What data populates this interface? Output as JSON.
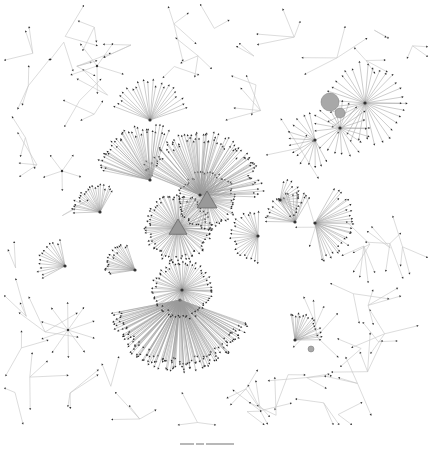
{
  "figure": {
    "type": "network-graph",
    "background": "#ffffff",
    "edge_color": "#9a9a9a",
    "node_color": "#2a2a2a",
    "highlight_color": "#a8a8a8",
    "caption": ""
  },
  "clusters": [
    {
      "name": "core-cluster-a",
      "cx": 178,
      "cy": 228,
      "r": 34,
      "count": 90,
      "shape": "triangle",
      "fan": [
        0,
        360
      ]
    },
    {
      "name": "core-cluster-b",
      "cx": 207,
      "cy": 200,
      "r": 30,
      "count": 70,
      "shape": "triangle",
      "fan": [
        0,
        360
      ]
    },
    {
      "name": "top-arc-cluster",
      "cx": 200,
      "cy": 195,
      "r": 62,
      "count": 90,
      "shape": "none",
      "fan": [
        200,
        360
      ]
    },
    {
      "name": "left-arc-cluster",
      "cx": 150,
      "cy": 180,
      "r": 55,
      "count": 40,
      "shape": "none",
      "fan": [
        190,
        290
      ]
    },
    {
      "name": "lower-cluster",
      "cx": 180,
      "cy": 300,
      "r": 70,
      "count": 140,
      "shape": "none",
      "fan": [
        20,
        170
      ]
    },
    {
      "name": "lower-dense-core",
      "cx": 182,
      "cy": 290,
      "r": 30,
      "count": 70,
      "shape": "none",
      "fan": [
        0,
        360
      ]
    },
    {
      "name": "fan-top",
      "cx": 150,
      "cy": 120,
      "r": 40,
      "count": 22,
      "shape": "none",
      "fan": [
        200,
        340
      ]
    },
    {
      "name": "right-hub-1",
      "cx": 315,
      "cy": 223,
      "r": 40,
      "count": 28,
      "shape": "none",
      "fan": [
        -60,
        80
      ]
    },
    {
      "name": "right-hub-2",
      "cx": 295,
      "cy": 222,
      "r": 30,
      "count": 18,
      "shape": "none",
      "fan": [
        180,
        300
      ]
    },
    {
      "name": "mid-hub",
      "cx": 258,
      "cy": 236,
      "r": 28,
      "count": 22,
      "shape": "none",
      "fan": [
        90,
        270
      ]
    },
    {
      "name": "left-hub",
      "cx": 100,
      "cy": 212,
      "r": 28,
      "count": 22,
      "shape": "none",
      "fan": [
        180,
        300
      ]
    },
    {
      "name": "far-left-hub",
      "cx": 65,
      "cy": 266,
      "r": 28,
      "count": 14,
      "shape": "none",
      "fan": [
        150,
        260
      ]
    },
    {
      "name": "left-mid-hub",
      "cx": 135,
      "cy": 270,
      "r": 30,
      "count": 20,
      "shape": "none",
      "fan": [
        170,
        250
      ]
    },
    {
      "name": "bottom-right-hub",
      "cx": 295,
      "cy": 340,
      "r": 28,
      "count": 18,
      "shape": "none",
      "fan": [
        -100,
        0
      ]
    },
    {
      "name": "tr-cluster-main",
      "cx": 365,
      "cy": 103,
      "r": 42,
      "count": 34,
      "shape": "none",
      "fan": [
        0,
        360
      ]
    },
    {
      "name": "tr-cluster-sub",
      "cx": 340,
      "cy": 128,
      "r": 30,
      "count": 22,
      "shape": "none",
      "fan": [
        0,
        360
      ]
    },
    {
      "name": "tr-cluster-left",
      "cx": 315,
      "cy": 140,
      "r": 28,
      "count": 14,
      "shape": "none",
      "fan": [
        60,
        260
      ]
    },
    {
      "name": "mid-right-hub",
      "cx": 280,
      "cy": 200,
      "r": 22,
      "count": 14,
      "shape": "none",
      "fan": [
        -80,
        60
      ]
    }
  ],
  "blobs": [
    {
      "name": "tr-blob-large",
      "cx": 330,
      "cy": 102,
      "r": 9
    },
    {
      "name": "tr-blob-small",
      "cx": 340,
      "cy": 113,
      "r": 5
    },
    {
      "name": "small-blob-right",
      "cx": 311,
      "cy": 349,
      "r": 3
    }
  ],
  "triangles": [
    {
      "name": "triangle-core-a",
      "cx": 178,
      "cy": 228,
      "size": 9
    },
    {
      "name": "triangle-core-b",
      "cx": 207,
      "cy": 201,
      "size": 10
    }
  ],
  "stars": [
    {
      "name": "star-left",
      "cx": 68,
      "cy": 330,
      "r": 28,
      "count": 10
    },
    {
      "name": "star-mid-left",
      "cx": 62,
      "cy": 171,
      "r": 20,
      "count": 5
    },
    {
      "name": "star-top",
      "cx": 97,
      "cy": 66,
      "r": 28,
      "count": 5
    }
  ],
  "trees_seed": 7,
  "trees_count": 60
}
